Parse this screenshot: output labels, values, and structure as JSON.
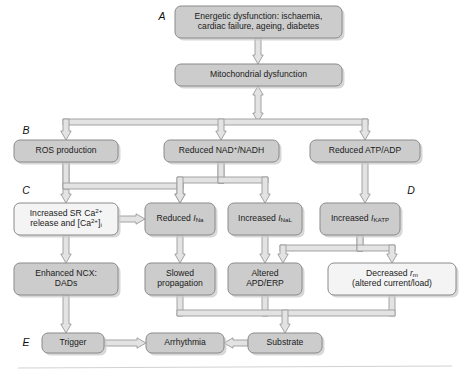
{
  "figure": {
    "width": 469,
    "height": 376,
    "background": "#ffffff",
    "box_fill_gray": "#cccccc",
    "box_fill_light": "#f4f4f4",
    "box_stroke": "#8a8a8a",
    "arrow_fill": "#e3e3e3",
    "arrow_stroke": "#9a9a9a",
    "text_color": "#1a1a1a"
  },
  "panel_labels": [
    {
      "id": "A",
      "text": "A",
      "x": 162,
      "y": 17
    },
    {
      "id": "B",
      "text": "B",
      "x": 26,
      "y": 131
    },
    {
      "id": "C",
      "text": "C",
      "x": 26,
      "y": 191
    },
    {
      "id": "D",
      "text": "D",
      "x": 411,
      "y": 191
    },
    {
      "id": "E",
      "text": "E",
      "x": 26,
      "y": 343
    }
  ],
  "nodes": [
    {
      "id": "energetic-dysfunction",
      "name": "node-energetic-dysfunction",
      "lines": [
        "Energetic dysfunction: ischaemia,",
        "cardiac failure, ageing, diabetes"
      ],
      "x": 175,
      "y": 6,
      "w": 167,
      "h": 32,
      "fill": "gray"
    },
    {
      "id": "mitochondrial-dysfunction",
      "name": "node-mitochondrial-dysfunction",
      "lines": [
        "Mitochondrial dysfunction"
      ],
      "x": 175,
      "y": 64,
      "w": 167,
      "h": 22,
      "fill": "gray"
    },
    {
      "id": "ros-production",
      "name": "node-ros-production",
      "lines": [
        "ROS production"
      ],
      "x": 14,
      "y": 140,
      "w": 104,
      "h": 22,
      "fill": "gray"
    },
    {
      "id": "reduced-nad-nadh",
      "name": "node-reduced-nad-nadh",
      "lines": [
        "Reduced NAD+/NADH"
      ],
      "rich": [
        [
          {
            "t": "Reduced NAD"
          },
          {
            "t": "+",
            "c": "sup"
          },
          {
            "t": "/NADH"
          }
        ]
      ],
      "x": 164,
      "y": 140,
      "w": 115,
      "h": 22,
      "fill": "gray"
    },
    {
      "id": "reduced-atp-adp",
      "name": "node-reduced-atp-adp",
      "lines": [
        "Reduced ATP/ADP"
      ],
      "x": 310,
      "y": 140,
      "w": 110,
      "h": 22,
      "fill": "gray"
    },
    {
      "id": "increased-sr-ca-release",
      "name": "node-increased-sr-ca-release",
      "lines": [
        "Increased SR Ca2+",
        "release and [Ca2+]i"
      ],
      "rich": [
        [
          {
            "t": "Increased SR Ca"
          },
          {
            "t": "2+",
            "c": "sup"
          }
        ],
        [
          {
            "t": "release and [Ca"
          },
          {
            "t": "2+",
            "c": "sup"
          },
          {
            "t": "]"
          },
          {
            "t": "i",
            "c": "sub"
          }
        ]
      ],
      "x": 14,
      "y": 203,
      "w": 104,
      "h": 32,
      "fill": "light"
    },
    {
      "id": "reduced-ina",
      "name": "node-reduced-ina",
      "lines": [
        "Reduced INa"
      ],
      "rich": [
        [
          {
            "t": "Reduced "
          },
          {
            "t": "I",
            "c": "ital"
          },
          {
            "t": "Na",
            "c": "sub"
          }
        ]
      ],
      "x": 145,
      "y": 203,
      "w": 70,
      "h": 32,
      "fill": "gray"
    },
    {
      "id": "increased-inal",
      "name": "node-increased-inal",
      "lines": [
        "Increased INaL"
      ],
      "rich": [
        [
          {
            "t": "Increased "
          },
          {
            "t": "I",
            "c": "ital"
          },
          {
            "t": "NaL",
            "c": "sub"
          }
        ]
      ],
      "x": 228,
      "y": 203,
      "w": 74,
      "h": 32,
      "fill": "gray"
    },
    {
      "id": "increased-ikatp",
      "name": "node-increased-ikatp",
      "lines": [
        "Increased IKATP"
      ],
      "rich": [
        [
          {
            "t": "Increased "
          },
          {
            "t": "I",
            "c": "ital"
          },
          {
            "t": "KATP",
            "c": "sub"
          }
        ]
      ],
      "x": 320,
      "y": 203,
      "w": 80,
      "h": 32,
      "fill": "gray"
    },
    {
      "id": "enhanced-ncx-dads",
      "name": "node-enhanced-ncx-dads",
      "lines": [
        "Enhanced NCX:",
        "DADs"
      ],
      "x": 14,
      "y": 263,
      "w": 104,
      "h": 32,
      "fill": "gray"
    },
    {
      "id": "slowed-propagation",
      "name": "node-slowed-propagation",
      "lines": [
        "Slowed",
        "propagation"
      ],
      "x": 145,
      "y": 263,
      "w": 70,
      "h": 32,
      "fill": "gray"
    },
    {
      "id": "altered-apd-erp",
      "name": "node-altered-apd-erp",
      "lines": [
        "Altered",
        "APD/ERP"
      ],
      "x": 228,
      "y": 263,
      "w": 74,
      "h": 32,
      "fill": "gray"
    },
    {
      "id": "decreased-rm",
      "name": "node-decreased-rm",
      "lines": [
        "Decreased rm",
        "(altered current/load)"
      ],
      "rich": [
        [
          {
            "t": "Decreased "
          },
          {
            "t": "r",
            "c": "ital"
          },
          {
            "t": "m",
            "c": "sub"
          }
        ],
        [
          {
            "t": "(altered current/load)"
          }
        ]
      ],
      "x": 328,
      "y": 263,
      "w": 128,
      "h": 32,
      "fill": "light"
    },
    {
      "id": "trigger",
      "name": "node-trigger",
      "lines": [
        "Trigger"
      ],
      "x": 42,
      "y": 333,
      "w": 62,
      "h": 20,
      "fill": "gray"
    },
    {
      "id": "arrhythmia",
      "name": "node-arrhythmia",
      "lines": [
        "Arrhythmia"
      ],
      "x": 146,
      "y": 333,
      "w": 78,
      "h": 20,
      "fill": "gray"
    },
    {
      "id": "substrate",
      "name": "node-substrate",
      "lines": [
        "Substrate"
      ],
      "x": 248,
      "y": 333,
      "w": 74,
      "h": 20,
      "fill": "gray"
    }
  ],
  "connectors": [
    {
      "id": "c-energetic-to-mito",
      "name": "arrow-energetic-to-mitochondrial",
      "kind": "v-arrow",
      "x": 258,
      "y1": 38,
      "y2": 64
    },
    {
      "id": "c-mito-to-bus",
      "name": "arrow-mitochondrial-to-bus-bidirectional",
      "kind": "v-arrow-double",
      "x": 258,
      "y1": 86,
      "y2": 122
    },
    {
      "id": "c-bus-row2",
      "name": "bus-row2-distribution",
      "kind": "bus-down",
      "y": 122,
      "xs": [
        66,
        221,
        365
      ],
      "from_x": 258
    },
    {
      "id": "c-ros-down",
      "name": "arrow-ros-to-sr-calcium",
      "kind": "v-arrow",
      "x": 66,
      "y1": 162,
      "y2": 203
    },
    {
      "id": "c-ros-to-ina",
      "name": "arrow-ros-to-reduced-ina",
      "kind": "elbow-right-down",
      "x1": 66,
      "y1": 162,
      "x2": 180,
      "y2": 203,
      "ymid": 186
    },
    {
      "id": "c-nad-to-ina",
      "name": "arrow-nad-to-reduced-ina",
      "kind": "elbow-left-down",
      "x1": 221,
      "y1": 162,
      "x2": 180,
      "y2": 203,
      "ymid": 180
    },
    {
      "id": "c-nad-to-inal",
      "name": "arrow-nad-to-increased-inal",
      "kind": "elbow-right-down",
      "x1": 221,
      "y1": 162,
      "x2": 265,
      "y2": 203,
      "ymid": 180
    },
    {
      "id": "c-atp-down",
      "name": "arrow-atp-to-increased-ikatp",
      "kind": "v-arrow",
      "x": 365,
      "y1": 162,
      "y2": 203
    },
    {
      "id": "c-sr-to-ina",
      "name": "arrow-sr-calcium-to-reduced-ina",
      "kind": "h-arrow-right",
      "y": 219,
      "x1": 118,
      "x2": 145
    },
    {
      "id": "c-sr-down",
      "name": "arrow-sr-calcium-to-ncx",
      "kind": "v-arrow",
      "x": 66,
      "y1": 235,
      "y2": 263
    },
    {
      "id": "c-ina-down",
      "name": "arrow-reduced-ina-to-slowed-propagation",
      "kind": "v-arrow",
      "x": 180,
      "y1": 235,
      "y2": 263
    },
    {
      "id": "c-inal-down",
      "name": "arrow-increased-inal-to-altered-apd",
      "kind": "v-arrow",
      "x": 265,
      "y1": 235,
      "y2": 263
    },
    {
      "id": "c-ikatp-to-apd",
      "name": "arrow-ikatp-to-altered-apd",
      "kind": "elbow-left-down",
      "x1": 360,
      "y1": 235,
      "x2": 283,
      "y2": 263,
      "ymid": 248
    },
    {
      "id": "c-ikatp-to-rm",
      "name": "arrow-ikatp-to-decreased-rm",
      "kind": "elbow-right-down",
      "x1": 360,
      "y1": 235,
      "x2": 392,
      "y2": 263,
      "ymid": 248
    },
    {
      "id": "c-ncx-to-trigger",
      "name": "arrow-ncx-to-trigger",
      "kind": "v-arrow",
      "x": 66,
      "y1": 295,
      "y2": 333
    },
    {
      "id": "c-merge-substrate",
      "name": "merge-to-substrate",
      "kind": "merge-up",
      "y": 313,
      "xs": [
        180,
        265,
        392
      ],
      "to_x": 285,
      "from_y": 295,
      "to_y": 333
    },
    {
      "id": "c-trigger-to-arrhythmia",
      "name": "arrow-trigger-to-arrhythmia",
      "kind": "h-arrow-right",
      "y": 343,
      "x1": 104,
      "x2": 146
    },
    {
      "id": "c-substrate-to-arrhythmia",
      "name": "arrow-substrate-to-arrhythmia",
      "kind": "h-arrow-left",
      "y": 343,
      "x1": 248,
      "x2": 224
    }
  ],
  "footer_rule": {
    "name": "footer-divider",
    "x1": 18,
    "y1": 368,
    "x2": 452,
    "y2": 366
  }
}
